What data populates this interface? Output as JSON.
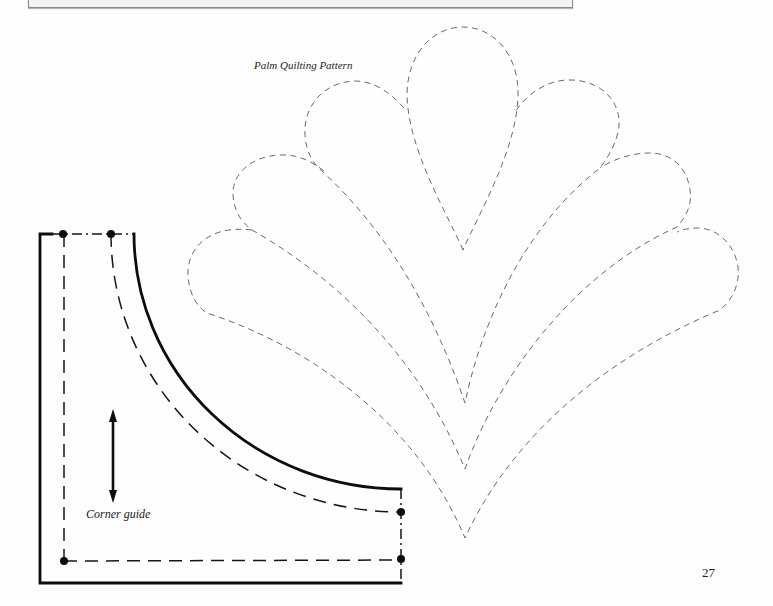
{
  "page": {
    "number": "27",
    "background_color": "#fefefe"
  },
  "top_box": {
    "fill_color": "#f4f4f4",
    "border_color": "#8a8a8a"
  },
  "palm_pattern": {
    "title": "Palm Quilting Pattern",
    "line_style": "dashed",
    "line_color": "#6a6a6a",
    "leaves": [
      {
        "name": "center-leaf"
      },
      {
        "name": "upper-leaf-pair"
      },
      {
        "name": "middle-leaf-pair"
      },
      {
        "name": "lower-leaf-pair"
      }
    ]
  },
  "corner_guide": {
    "label": "Corner guide",
    "line_color": "#0d0d0d",
    "icons": {
      "grain_arrow": "double-headed-arrow-icon",
      "registration_dot": "dot-marker-icon"
    }
  }
}
